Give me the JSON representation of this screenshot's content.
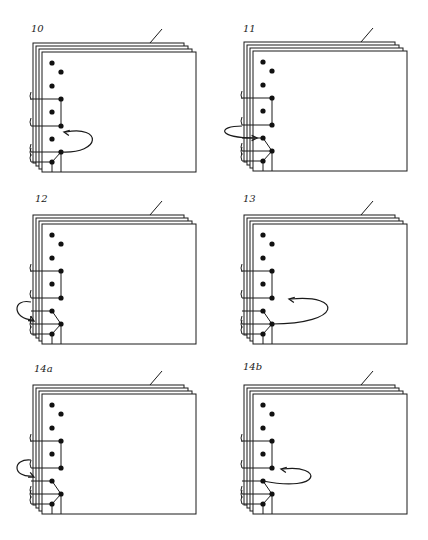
{
  "header_fragment": "",
  "colors": {
    "line": "#1a1a1a",
    "dot": "#111111",
    "background": "#ffffff"
  },
  "sheet": {
    "width": 154,
    "height": 120,
    "stack_count": 4,
    "stack_offset": 3
  },
  "panels": [
    {
      "id": "10",
      "label": "10",
      "label_pos": [
        31,
        33
      ],
      "origin": [
        42,
        52
      ],
      "arrow": "right-loop-from-lower-b-to-gap-a"
    },
    {
      "id": "11",
      "label": "11",
      "label_pos": [
        243,
        33
      ],
      "origin": [
        253,
        51
      ],
      "arrow": "left-loop-into-a4"
    },
    {
      "id": "12",
      "label": "12",
      "label_pos": [
        35,
        203
      ],
      "origin": [
        42,
        224
      ],
      "arrow": "left-loop-into-spine-low"
    },
    {
      "id": "13",
      "label": "13",
      "label_pos": [
        243,
        203
      ],
      "origin": [
        253,
        224
      ],
      "arrow": "right-loop-from-b5-to-gap-above"
    },
    {
      "id": "14a",
      "label": "14a",
      "label_pos": [
        34,
        373
      ],
      "origin": [
        42,
        394
      ],
      "arrow": "left-loop-into-spine-mid"
    },
    {
      "id": "14b",
      "label": "14b",
      "label_pos": [
        243,
        371
      ],
      "origin": [
        253,
        394
      ],
      "arrow": "right-loop-from-a4-to-b3"
    }
  ]
}
